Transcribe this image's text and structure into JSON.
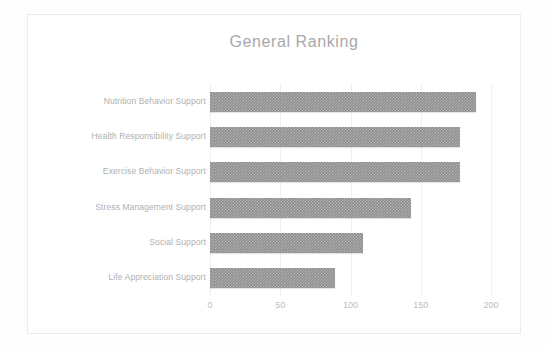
{
  "chart_data": {
    "type": "bar",
    "orientation": "horizontal",
    "title": "General Ranking",
    "xlabel": "",
    "ylabel": "",
    "categories": [
      "Nutrition Behavior Support",
      "Health Responsibility Support",
      "Exercise Behavior Support",
      "Stress Management Support",
      "Social Support",
      "Life Appreciation Support"
    ],
    "values": [
      189,
      178,
      178,
      143,
      109,
      89
    ],
    "xlim": [
      0,
      200
    ],
    "xticks": [
      "0",
      "50",
      "100",
      "150",
      "200"
    ],
    "xtick_values": [
      0,
      50,
      100,
      150,
      200
    ],
    "grid": true,
    "grid_axis": "x",
    "legend": false,
    "bar_color": "#8d8d8d",
    "title_color": "#a8a8a8",
    "label_color": "#b0b0b0",
    "tick_color": "#bdbdbd",
    "frame_color": "#ececec",
    "background": "#ffffff"
  }
}
